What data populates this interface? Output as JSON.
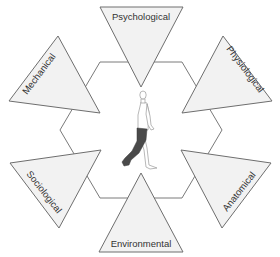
{
  "diagram": {
    "center": {
      "figure": "walking-person-icon",
      "highlighted_part": "left-leg"
    },
    "factors": [
      {
        "id": "psychological",
        "label": "Psychological",
        "position": "top"
      },
      {
        "id": "physiological",
        "label": "Physiological",
        "position": "upper-right"
      },
      {
        "id": "anatomical",
        "label": "Anatomical",
        "position": "lower-right"
      },
      {
        "id": "environmental",
        "label": "Environmental",
        "position": "bottom"
      },
      {
        "id": "sociological",
        "label": "Sociological",
        "position": "lower-left"
      },
      {
        "id": "mechanical",
        "label": "Mechanical",
        "position": "upper-left"
      }
    ],
    "colors": {
      "triangle_fill": "#f2f2f2",
      "stroke": "#6e6e6e",
      "leg_highlight": "#4a4a4a"
    }
  }
}
